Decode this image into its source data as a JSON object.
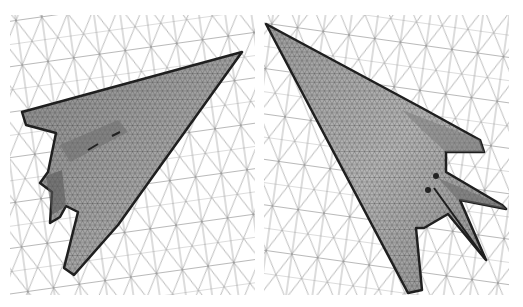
{
  "figure": {
    "panels": [
      {
        "id": "left",
        "label": "",
        "view": "top-view-mesh",
        "background_grid": "volume-mesh-wireframe",
        "surface": "aircraft-surface-mesh"
      },
      {
        "id": "right",
        "label": "",
        "view": "bottom-view-mesh",
        "background_grid": "volume-mesh-wireframe",
        "surface": "aircraft-surface-mesh"
      }
    ],
    "colors": {
      "background": "#ffffff",
      "grid_line": "#8a8a8a",
      "surface_fill": "#9a9a9a",
      "surface_mesh": "#2a2a2a",
      "edge_outline": "#1e1e1e"
    }
  }
}
